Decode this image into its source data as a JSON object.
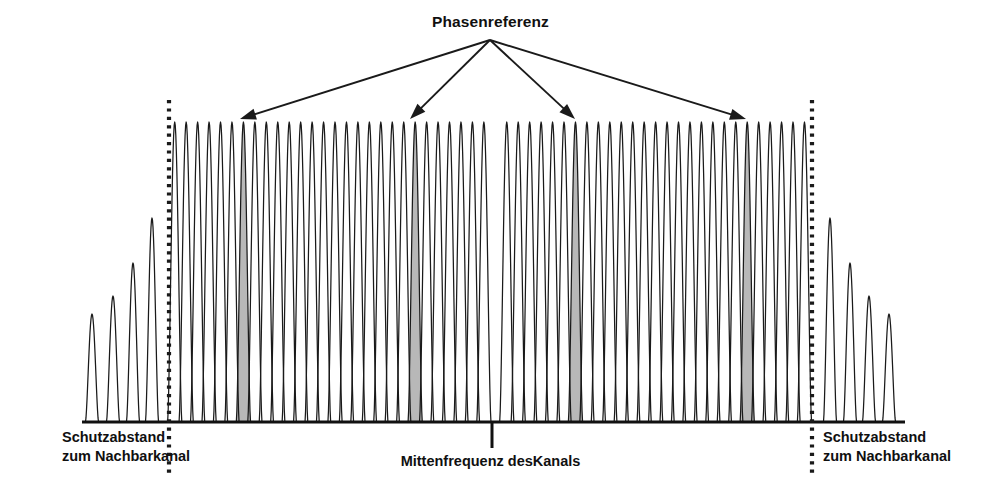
{
  "figure": {
    "title": "Phasenreferenz",
    "center_frequency_label": "Mittenfrequenz desKanals",
    "left_guard_band": {
      "line1": "Schutzabstand",
      "line2": "zum Nachbarkanal"
    },
    "right_guard_band": {
      "line1": "Schutzabstand",
      "line2": "zum Nachbarkanal"
    }
  },
  "colors": {
    "stroke": "#1a1a1a",
    "pilot_fill": "#b8b8b8",
    "background": "#ffffff",
    "axis": "#111111"
  },
  "chart_data": {
    "type": "line",
    "title": "Phasenreferenz",
    "subtitle": "",
    "xlabel": "Mittenfrequenz desKanals",
    "ylabel": "",
    "grid": false,
    "legend_position": "none",
    "axis": {
      "x_start_px": 82,
      "x_end_px": 905,
      "baseline_y_px": 422
    },
    "xlim": [
      82,
      905
    ],
    "ylim": [
      0,
      1
    ],
    "envelope_top_y_px": 122,
    "subcarrier_spacing_px": 11.45,
    "in_band": {
      "x_start_px": 169,
      "x_end_px": 812,
      "subcarrier_count": 56
    },
    "center_null": {
      "x_px": 492,
      "present": true,
      "tick_length_px": 26
    },
    "guard_bands": {
      "left": {
        "boundary_x_px": 169,
        "sidelobe_peaks_x_px": [
          92,
          113,
          133,
          152
        ],
        "sidelobe_peak_heights": [
          0.36,
          0.42,
          0.53,
          0.68
        ]
      },
      "right": {
        "boundary_x_px": 812,
        "sidelobe_peaks_x_px": [
          830,
          850,
          869,
          889
        ],
        "sidelobe_peak_heights": [
          0.68,
          0.53,
          0.42,
          0.36
        ]
      }
    },
    "boundary_markers": {
      "style": "dotted-vertical",
      "lines_x_px": [
        169,
        812
      ],
      "y_top_px": 100,
      "y_bottom_px": 478
    },
    "pilots": {
      "label": "Phasenreferenz",
      "fill": "#b8b8b8",
      "count": 4,
      "x_px": [
        239,
        410,
        575,
        748
      ]
    },
    "annotation_arrows": {
      "origin_x_px": 490,
      "origin_y_px": 40,
      "targets_x_px": [
        240,
        410,
        575,
        746
      ],
      "targets_y_px": [
        119,
        119,
        119,
        119
      ]
    }
  }
}
